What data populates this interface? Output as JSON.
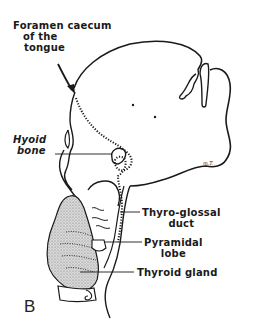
{
  "figure": {
    "panel_letter": "B",
    "artist_signature": "m.T.",
    "labels": {
      "foramen_caecum_line1": "Foramen caecum",
      "foramen_caecum_line2": "of the",
      "foramen_caecum_line3": "tongue",
      "hyoid_line1": "Hyoid",
      "hyoid_line2": "bone",
      "thyroglossal_line1": "Thyro-glossal",
      "thyroglossal_line2": "duct",
      "pyramidal_line1": "Pyramidal",
      "pyramidal_line2": "lobe",
      "thyroid_gland": "Thyroid gland"
    },
    "colors": {
      "ink": "#1a1a1a",
      "gland_stipple": "#b8b8b8",
      "background": "#ffffff"
    }
  }
}
